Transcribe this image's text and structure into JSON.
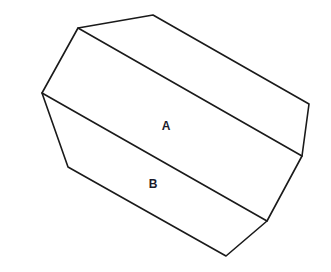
{
  "diagram": {
    "type": "prism-polygon",
    "outline": [
      [
        78,
        28
      ],
      [
        153,
        15
      ],
      [
        309,
        104
      ],
      [
        302,
        156
      ],
      [
        267,
        221
      ],
      [
        226,
        256
      ],
      [
        68,
        167
      ],
      [
        42,
        93
      ]
    ],
    "inner_edges": [
      {
        "from": [
          78,
          28
        ],
        "to": [
          302,
          156
        ]
      },
      {
        "from": [
          42,
          93
        ],
        "to": [
          267,
          221
        ]
      }
    ],
    "labels": [
      {
        "text": "A",
        "x": 166,
        "y": 130
      },
      {
        "text": "B",
        "x": 153,
        "y": 188
      }
    ],
    "stroke_color": "#1a1a1a",
    "background": "#ffffff"
  }
}
